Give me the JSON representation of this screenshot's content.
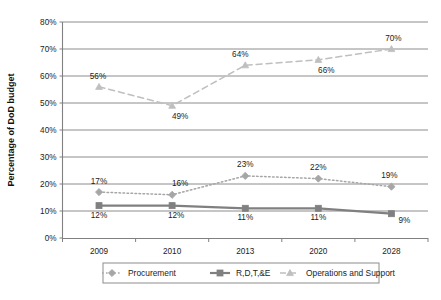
{
  "chart_data": {
    "type": "line",
    "title": "",
    "xlabel": "",
    "ylabel": "Percentage of DoD budget",
    "categories": [
      "2009",
      "2010",
      "2013",
      "2020",
      "2028"
    ],
    "ylim": [
      0,
      80
    ],
    "yticks": [
      "0%",
      "10%",
      "20%",
      "30%",
      "40%",
      "50%",
      "60%",
      "70%",
      "80%"
    ],
    "ytick_values": [
      0,
      10,
      20,
      30,
      40,
      50,
      60,
      70,
      80
    ],
    "grid": true,
    "legend_position": "bottom",
    "series": [
      {
        "name": "Procurement",
        "values": [
          17,
          16,
          23,
          22,
          19
        ],
        "labels": [
          "17%",
          "16%",
          "23%",
          "22%",
          "19%"
        ],
        "line_style": "dotted",
        "marker": "diamond",
        "color": "#a6a6a6"
      },
      {
        "name": "R,D,T,&E",
        "values": [
          12,
          12,
          11,
          11,
          9
        ],
        "labels": [
          "12%",
          "12%",
          "11%",
          "11%",
          "9%"
        ],
        "line_style": "solid",
        "marker": "square",
        "color": "#808080"
      },
      {
        "name": "Operations and Support",
        "values": [
          56,
          49,
          64,
          66,
          70
        ],
        "labels": [
          "56%",
          "49%",
          "64%",
          "66%",
          "70%"
        ],
        "line_style": "dashed",
        "marker": "triangle",
        "color": "#bfbfbf"
      }
    ]
  },
  "legend": {
    "items": [
      {
        "label": "Procurement"
      },
      {
        "label": "R,D,T,&E"
      },
      {
        "label": "Operations and Support"
      }
    ]
  },
  "colors": {
    "axis": "#808080",
    "grid": "#808080",
    "text": "#1c1c1c",
    "background": "#ffffff"
  }
}
